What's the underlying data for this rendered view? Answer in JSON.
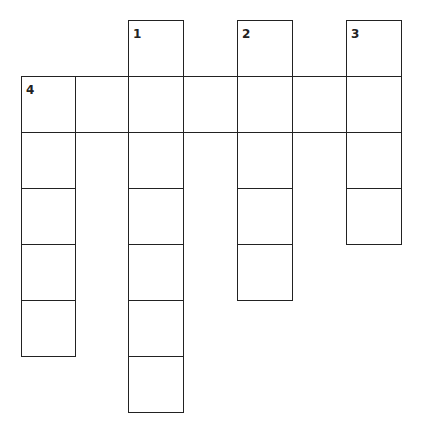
{
  "puzzle": {
    "type": "crossword",
    "colors": {
      "line": "#222222",
      "cell": "#ffffff",
      "background": "#ffffff"
    },
    "layout": {
      "col_x": [
        21,
        75,
        128,
        183,
        237,
        292,
        346,
        401
      ],
      "row_y": [
        20,
        76,
        132,
        188,
        244,
        300,
        356,
        412
      ]
    },
    "cells": [
      {
        "row": 0,
        "col": 2,
        "number": "1"
      },
      {
        "row": 0,
        "col": 4,
        "number": "2"
      },
      {
        "row": 0,
        "col": 6,
        "number": "3"
      },
      {
        "row": 1,
        "col": 0,
        "number": "4"
      },
      {
        "row": 1,
        "col": 1
      },
      {
        "row": 1,
        "col": 2
      },
      {
        "row": 1,
        "col": 3
      },
      {
        "row": 1,
        "col": 4
      },
      {
        "row": 1,
        "col": 5
      },
      {
        "row": 1,
        "col": 6
      },
      {
        "row": 2,
        "col": 0
      },
      {
        "row": 2,
        "col": 2
      },
      {
        "row": 2,
        "col": 4
      },
      {
        "row": 2,
        "col": 6
      },
      {
        "row": 3,
        "col": 0
      },
      {
        "row": 3,
        "col": 2
      },
      {
        "row": 3,
        "col": 4
      },
      {
        "row": 3,
        "col": 6
      },
      {
        "row": 4,
        "col": 0
      },
      {
        "row": 4,
        "col": 2
      },
      {
        "row": 4,
        "col": 4
      },
      {
        "row": 5,
        "col": 0
      },
      {
        "row": 5,
        "col": 2
      },
      {
        "row": 6,
        "col": 2
      }
    ],
    "words": [
      {
        "number": "1",
        "direction": "down",
        "length": 7
      },
      {
        "number": "2",
        "direction": "down",
        "length": 5
      },
      {
        "number": "3",
        "direction": "down",
        "length": 4
      },
      {
        "number": "4",
        "direction": "across",
        "length": 7
      },
      {
        "number": "4",
        "direction": "down",
        "length": 5
      }
    ]
  }
}
